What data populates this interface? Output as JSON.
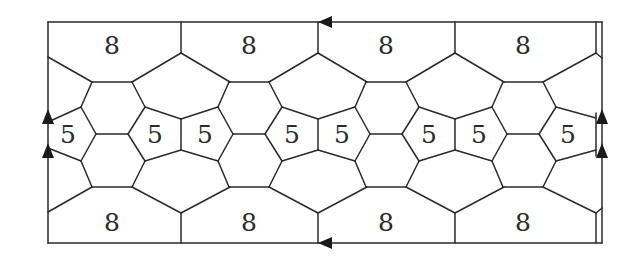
{
  "diagram": {
    "stroke_color": "#2a2a2a",
    "background": "#ffffff",
    "frame": {
      "left": 48,
      "right": 602,
      "inner_right": 596,
      "top": 22,
      "bottom": 243
    },
    "period": 137,
    "labels": {
      "octagon_top": [
        {
          "text": "8",
          "x": 112,
          "y": 45
        },
        {
          "text": "8",
          "x": 249,
          "y": 45
        },
        {
          "text": "8",
          "x": 386,
          "y": 45
        },
        {
          "text": "8",
          "x": 523,
          "y": 45
        }
      ],
      "pentagon_row": [
        {
          "text": "5",
          "x": 68,
          "y": 134
        },
        {
          "text": "5",
          "x": 155,
          "y": 134
        },
        {
          "text": "5",
          "x": 205,
          "y": 134
        },
        {
          "text": "5",
          "x": 292,
          "y": 134
        },
        {
          "text": "5",
          "x": 342,
          "y": 134
        },
        {
          "text": "5",
          "x": 429,
          "y": 134
        },
        {
          "text": "5",
          "x": 479,
          "y": 134
        },
        {
          "text": "5",
          "x": 568,
          "y": 134
        }
      ],
      "octagon_bottom": [
        {
          "text": "8",
          "x": 112,
          "y": 222
        },
        {
          "text": "8",
          "x": 249,
          "y": 222
        },
        {
          "text": "8",
          "x": 386,
          "y": 222
        },
        {
          "text": "8",
          "x": 523,
          "y": 222
        }
      ]
    },
    "arrows": [
      {
        "name": "top-edge-arrow",
        "direction": "left",
        "x": 318,
        "y": 22
      },
      {
        "name": "bottom-edge-arrow",
        "direction": "left",
        "x": 318,
        "y": 243
      },
      {
        "name": "left-edge-arrow-upper",
        "direction": "up",
        "x": 48,
        "y": 109
      },
      {
        "name": "left-edge-arrow-lower",
        "direction": "up",
        "x": 48,
        "y": 143
      },
      {
        "name": "right-edge-arrow-upper",
        "direction": "up",
        "x": 602,
        "y": 109
      },
      {
        "name": "right-edge-arrow-lower",
        "direction": "up",
        "x": 602,
        "y": 143
      }
    ]
  }
}
